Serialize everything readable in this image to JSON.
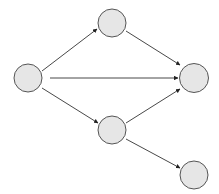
{
  "diagram": {
    "type": "directed-graph",
    "colors": {
      "node_fill": "#e6e6e6",
      "node_stroke": "#555555",
      "edge": "#333333",
      "background": "#ffffff"
    },
    "nodes": [
      {
        "id": "n1",
        "label": "",
        "cx": 28,
        "cy": 78,
        "r": 14
      },
      {
        "id": "n2",
        "label": "",
        "cx": 112,
        "cy": 23,
        "r": 14
      },
      {
        "id": "n3",
        "label": "",
        "cx": 194,
        "cy": 78,
        "r": 14.5
      },
      {
        "id": "n4",
        "label": "",
        "cx": 112,
        "cy": 130,
        "r": 14
      },
      {
        "id": "n5",
        "label": "",
        "cx": 194,
        "cy": 175,
        "r": 14
      }
    ],
    "edges": [
      {
        "from": "n1",
        "to": "n2",
        "x1": 42,
        "y1": 71,
        "x2": 97,
        "y2": 29
      },
      {
        "from": "n1",
        "to": "n3",
        "x1": 50,
        "y1": 78,
        "x2": 178,
        "y2": 78
      },
      {
        "from": "n1",
        "to": "n4",
        "x1": 42,
        "y1": 88,
        "x2": 98,
        "y2": 123
      },
      {
        "from": "n2",
        "to": "n3",
        "x1": 126,
        "y1": 31,
        "x2": 180,
        "y2": 65
      },
      {
        "from": "n4",
        "to": "n3",
        "x1": 126,
        "y1": 123,
        "x2": 180,
        "y2": 89
      },
      {
        "from": "n4",
        "to": "n5",
        "x1": 126,
        "y1": 139,
        "x2": 180,
        "y2": 168
      }
    ]
  }
}
